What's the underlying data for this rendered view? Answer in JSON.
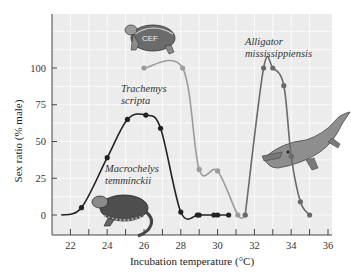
{
  "chart_data": {
    "type": "line",
    "title": "",
    "xlabel": "Incubation temperature (°C)",
    "ylabel": "Sex ratio (% male)",
    "xlim": [
      21,
      36
    ],
    "ylim": [
      -5,
      125
    ],
    "xticks": [
      22,
      24,
      26,
      28,
      30,
      32,
      34,
      36
    ],
    "yticks": [
      0,
      25,
      50,
      75,
      100
    ],
    "grid": true,
    "legend": "none (species labeled inline with illustrations)",
    "series": [
      {
        "name": "Macrochelys temminckii",
        "color": "#222222",
        "x": [
          21.5,
          22.6,
          24.0,
          25.1,
          26.1,
          26.9,
          28.0,
          28.9,
          29.0,
          29.8,
          30.0,
          30.6
        ],
        "y": [
          0,
          5,
          39,
          65,
          68,
          59,
          2,
          0,
          0,
          0,
          0,
          0
        ]
      },
      {
        "name": "Trachemys scripta",
        "color": "#9c9c9c",
        "x": [
          26.0,
          28.1,
          29.0,
          30.0,
          31.1,
          31.5
        ],
        "y": [
          100,
          100,
          31,
          30,
          0,
          0
        ]
      },
      {
        "name": "Alligator mississippiensis",
        "color": "#6a6a6a",
        "x": [
          31.5,
          32.5,
          33.0,
          33.6,
          34.0,
          34.5,
          35.0
        ],
        "y": [
          0,
          100,
          100,
          88,
          40,
          9,
          0
        ]
      }
    ],
    "annotations": [
      {
        "text": [
          "Trachemys",
          "scripta"
        ],
        "near": "Trachemys scripta curve, with turtle illustration"
      },
      {
        "text": [
          "Alligator",
          "mississippiensis"
        ],
        "near": "Alligator curve, with alligator illustration"
      },
      {
        "text": [
          "Macrochelys",
          "temminckii"
        ],
        "near": "Macrochelys curve, with snapping turtle illustration"
      }
    ]
  },
  "labels": {
    "xlabel": "Incubation temperature (°C)",
    "ylabel": "Sex ratio (% male)",
    "xticks": [
      "22",
      "24",
      "26",
      "28",
      "30",
      "32",
      "34",
      "36"
    ],
    "yticks": [
      "0",
      "25",
      "50",
      "75",
      "100"
    ],
    "species": {
      "trachemys": [
        "Trachemys",
        "scripta"
      ],
      "alligator": [
        "Alligator",
        "mississippiensis"
      ],
      "macrochelys": [
        "Macrochelys",
        "temminckii"
      ]
    }
  },
  "colors": {
    "plot_bg": "#ececec",
    "grid": "#ffffff",
    "axis": "#444444"
  }
}
